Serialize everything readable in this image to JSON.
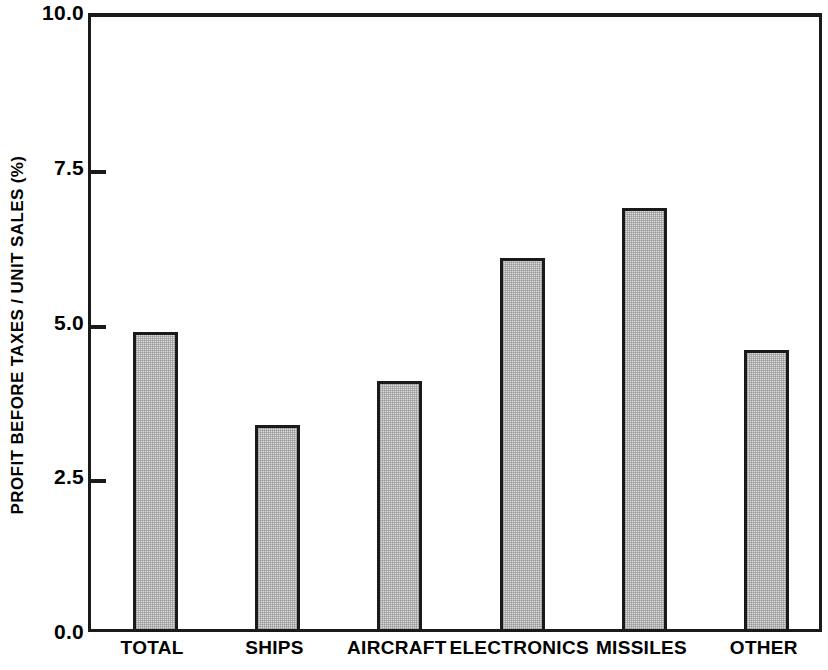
{
  "chart_data": {
    "type": "bar",
    "title": "",
    "xlabel": "",
    "ylabel": "PROFIT BEFORE TAXES / UNIT SALES (%)",
    "categories": [
      "TOTAL",
      "SHIPS",
      "AIRCRAFT",
      "ELECTRONICS",
      "MISSILES",
      "OTHER"
    ],
    "values": [
      4.8,
      3.3,
      4.0,
      6.0,
      6.8,
      4.5
    ],
    "ylim": [
      0.0,
      10.0
    ],
    "yticks": [
      0.0,
      2.5,
      5.0,
      7.5,
      10.0
    ],
    "ytick_labels": [
      "0.0",
      "2.5",
      "5.0",
      "7.5",
      "10.0"
    ],
    "grid": false,
    "legend": null,
    "bar_fill_color": "#dcdcdc",
    "bar_edge_color": "#1a1a1a",
    "background_color": "#ffffff"
  }
}
